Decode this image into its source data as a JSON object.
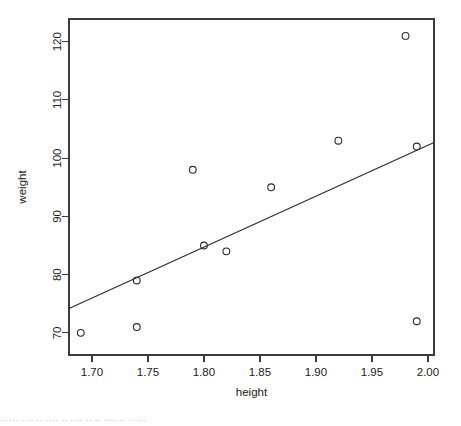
{
  "chart_data": {
    "type": "scatter",
    "title": "",
    "xlabel": "height",
    "ylabel": "weight",
    "xlim": [
      1.6795,
      2.0054
    ],
    "ylim": [
      66.2,
      123.9
    ],
    "grid": false,
    "legend": "none",
    "xticks": [
      "1.70",
      "1.75",
      "1.80",
      "1.85",
      "1.90",
      "1.95",
      "2.00"
    ],
    "xtick_values": [
      1.7,
      1.75,
      1.8,
      1.85,
      1.9,
      1.95,
      2.0
    ],
    "yticks": [
      "70",
      "80",
      "90",
      "100",
      "110",
      "120"
    ],
    "ytick_values": [
      70,
      80,
      90,
      100,
      110,
      120
    ],
    "marker": "open-circle",
    "points": [
      {
        "x": 1.69,
        "y": 70
      },
      {
        "x": 1.74,
        "y": 71
      },
      {
        "x": 1.74,
        "y": 79
      },
      {
        "x": 1.79,
        "y": 98
      },
      {
        "x": 1.8,
        "y": 85
      },
      {
        "x": 1.82,
        "y": 84
      },
      {
        "x": 1.86,
        "y": 95
      },
      {
        "x": 1.92,
        "y": 103
      },
      {
        "x": 1.98,
        "y": 121
      },
      {
        "x": 1.99,
        "y": 102
      },
      {
        "x": 1.99,
        "y": 72
      }
    ],
    "series": [
      {
        "name": "regression-line",
        "type": "line",
        "x": [
          1.6795,
          2.0054
        ],
        "y": [
          74.2,
          102.7
        ]
      }
    ]
  },
  "footer": {
    "text": "·· ··· · ··   ·· ····      ··   ···· ··    ·· ····     ··     ·· ···"
  }
}
